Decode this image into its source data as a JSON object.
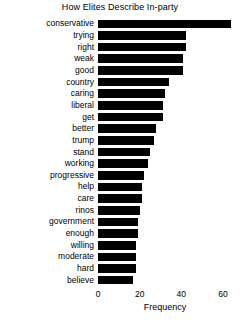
{
  "chart_data": {
    "type": "bar",
    "orientation": "horizontal",
    "title": "How Elites Describe In-party",
    "xlabel": "Frequency",
    "ylabel": "",
    "xlim": [
      0,
      64
    ],
    "xticks": [
      0,
      20,
      40,
      60
    ],
    "xtick_labels": [
      "0",
      "20",
      "40",
      "60"
    ],
    "grid": false,
    "legend": false,
    "bar_color": "#000000",
    "background_color": "#ffffff",
    "categories": [
      "conservative",
      "trying",
      "right",
      "weak",
      "good",
      "country",
      "caring",
      "liberal",
      "get",
      "better",
      "trump",
      "stand",
      "working",
      "progressive",
      "help",
      "care",
      "rinos",
      "government",
      "enough",
      "willing",
      "moderate",
      "hard",
      "believe"
    ],
    "values": [
      64,
      42,
      42,
      41,
      41,
      34,
      32,
      31,
      31,
      28,
      27,
      25,
      24,
      22,
      21,
      21,
      20,
      19,
      19,
      18,
      18,
      18,
      17
    ]
  }
}
